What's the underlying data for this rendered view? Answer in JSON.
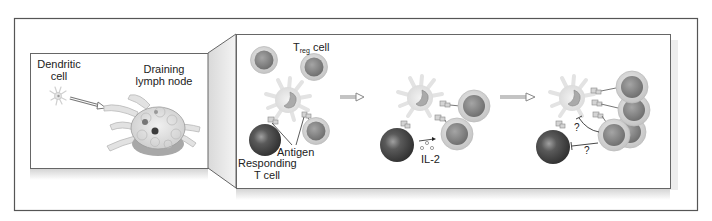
{
  "figure": {
    "overview_panel": {
      "dendritic_cell_label_line1": "Dendritic",
      "dendritic_cell_label_line2": "cell",
      "lymph_node_label_line1": "Draining",
      "lymph_node_label_line2": "lymph node"
    },
    "zoom_panel": {
      "stage1": {
        "treg_label_main": "T",
        "treg_label_sub": "reg",
        "treg_label_suffix": " cell",
        "antigen_label": "Antigen",
        "responding_label_line1": "Responding",
        "responding_label_line2": "T cell"
      },
      "stage2": {
        "il2_label": "IL-2"
      },
      "stage3": {
        "question_mark_1": "?",
        "question_mark_2": "?"
      }
    },
    "colors": {
      "frame_border": "#555555",
      "panel_border": "#666666",
      "treg_outer": "#d9d9d9",
      "treg_inner": "#8a8a8a",
      "responding_cell": "#4a4a4a",
      "dendritic_cell": "#e8e8e8",
      "arrow": "#888888"
    }
  }
}
